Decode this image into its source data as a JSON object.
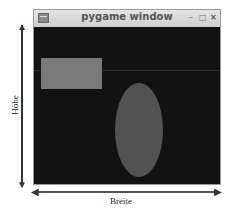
{
  "window": {
    "title": "pygame window",
    "controls": {
      "minimize": "–",
      "maximize": "□",
      "close": "×"
    }
  },
  "canvas": {
    "background": "#121212",
    "shapes": [
      {
        "type": "rectangle",
        "color": "#7a7a7a"
      },
      {
        "type": "ellipse",
        "color": "#525252"
      }
    ]
  },
  "annotations": {
    "height_label": "Höhe",
    "width_label": "Breite"
  }
}
